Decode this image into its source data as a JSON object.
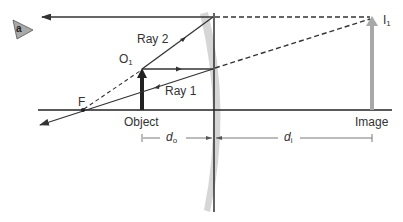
{
  "figure": {
    "panel_label": "a",
    "labels": {
      "ray2": "Ray 2",
      "ray1": "Ray 1",
      "object_point": "O",
      "object_point_sub": "1",
      "image_point": "I",
      "image_point_sub": "1",
      "focal_point": "F",
      "object": "Object",
      "image": "Image",
      "d_o": "d",
      "d_o_sub": "o",
      "d_i": "d",
      "d_i_sub": "i"
    },
    "colors": {
      "ray": "#333333",
      "axis": "#222222",
      "lens": "#d4d4d4",
      "image_arrow": "#a8a8a8",
      "object_arrow": "#222222",
      "badge": "#a9a9a9"
    }
  }
}
